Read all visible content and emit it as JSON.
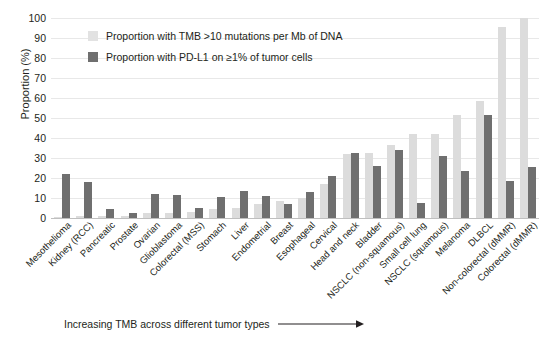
{
  "chart_data": {
    "type": "bar",
    "title": "",
    "xlabel": "Increasing TMB across different tumor types",
    "ylabel": "Proportion (%)",
    "ylim": [
      0,
      100
    ],
    "yticks": [
      0,
      10,
      20,
      30,
      40,
      50,
      60,
      70,
      80,
      90,
      100
    ],
    "grid": true,
    "legend_position": "top-left",
    "colors": {
      "tmb": "#dcdcdc",
      "pdl1": "#6f6f6f"
    },
    "categories": [
      "Mesothelioma",
      "Kidney (RCC)",
      "Pancreatic",
      "Prostate",
      "Ovarian",
      "Glioblastoma",
      "Colorectal (MSS)",
      "Stomach",
      "Liver",
      "Endometrial",
      "Breast",
      "Esophageal",
      "Cervical",
      "Head and neck",
      "Bladder",
      "NSCLC (non-squamous)",
      "Small cell lung",
      "NSCLC (squamous)",
      "Melanoma",
      "DLBCL",
      "Non-colorectal (dMMR)",
      "Colorectal (dMMR)"
    ],
    "series": [
      {
        "name": "Proportion with TMB >10 mutations per Mb of DNA",
        "key": "tmb",
        "values": [
          0.5,
          0.8,
          0.8,
          1.2,
          2.3,
          2.5,
          3.0,
          4.3,
          5.2,
          7.2,
          8.6,
          9.8,
          17.2,
          32.1,
          32.4,
          36.6,
          41.8,
          41.9,
          51.7,
          58.3,
          95.3,
          99.8
        ]
      },
      {
        "name": "Proportion with PD-L1 on ≥1% of tumor cells",
        "key": "pdl1",
        "values": [
          22.0,
          18.0,
          4.6,
          2.7,
          11.8,
          11.7,
          4.8,
          10.3,
          13.7,
          11.0,
          7.0,
          12.8,
          21.0,
          32.7,
          26.0,
          34.1,
          7.6,
          31.1,
          23.6,
          51.3,
          18.6,
          25.6
        ]
      }
    ]
  },
  "legend": {
    "items": [
      {
        "label": "Proportion with TMB >10 mutations per Mb of DNA",
        "key": "tmb"
      },
      {
        "label": "Proportion with PD-L1 on ≥1% of tumor cells",
        "key": "pdl1"
      }
    ]
  },
  "caption": {
    "text": "Increasing TMB across different tumor types",
    "arrow_icon": "right-arrow-icon"
  }
}
